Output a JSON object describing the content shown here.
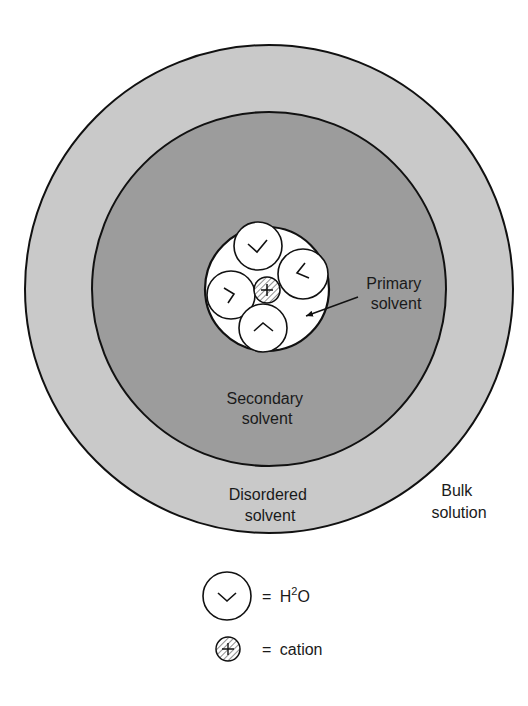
{
  "diagram": {
    "colors": {
      "background": "#ffffff",
      "outer_ring": "#c9c9c9",
      "middle_ring": "#9c9c9c",
      "primary_shell": "#ffffff",
      "stroke": "#111111"
    },
    "regions": {
      "primary": {
        "line1": "Primary",
        "line2": "solvent"
      },
      "secondary": {
        "line1": "Secondary",
        "line2": "solvent"
      },
      "disordered": {
        "line1": "Disordered",
        "line2": "solvent"
      },
      "bulk": {
        "line1": "Bulk",
        "line2": "solution"
      }
    },
    "legend": {
      "water": {
        "equals": "=",
        "label_base": "H",
        "label_sup": "2",
        "label_end": "O"
      },
      "cation": {
        "equals": "=",
        "label": "cation"
      }
    }
  }
}
